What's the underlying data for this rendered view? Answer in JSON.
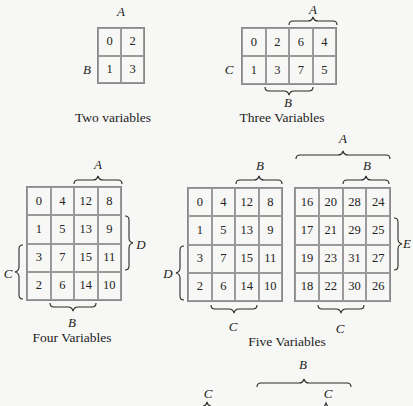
{
  "maps": {
    "two": {
      "caption": "Two variables",
      "cells": [
        "0",
        "2",
        "1",
        "3"
      ],
      "labels": {
        "A": "A",
        "B": "B"
      }
    },
    "three": {
      "caption": "Three Variables",
      "cells": [
        "0",
        "2",
        "6",
        "4",
        "1",
        "3",
        "7",
        "5"
      ],
      "labels": {
        "A": "A",
        "B": "B",
        "C": "C"
      }
    },
    "four": {
      "caption": "Four Variables",
      "cells": [
        "0",
        "4",
        "12",
        "8",
        "1",
        "5",
        "13",
        "9",
        "3",
        "7",
        "15",
        "11",
        "2",
        "6",
        "14",
        "10"
      ],
      "labels": {
        "A": "A",
        "B": "B",
        "C": "C",
        "D": "D"
      }
    },
    "five": {
      "caption": "Five Variables",
      "left_cells": [
        "0",
        "4",
        "12",
        "8",
        "1",
        "5",
        "13",
        "9",
        "3",
        "7",
        "15",
        "11",
        "2",
        "6",
        "14",
        "10"
      ],
      "right_cells": [
        "16",
        "20",
        "28",
        "24",
        "17",
        "21",
        "29",
        "25",
        "19",
        "23",
        "31",
        "27",
        "18",
        "22",
        "30",
        "26"
      ],
      "labels": {
        "A": "A",
        "B_left": "B",
        "B_right": "B",
        "C_left": "C",
        "C_right": "C",
        "D": "D",
        "E": "E"
      }
    },
    "six_partial": {
      "labels": {
        "B": "B",
        "C_left": "C",
        "C_right": "C"
      }
    }
  }
}
